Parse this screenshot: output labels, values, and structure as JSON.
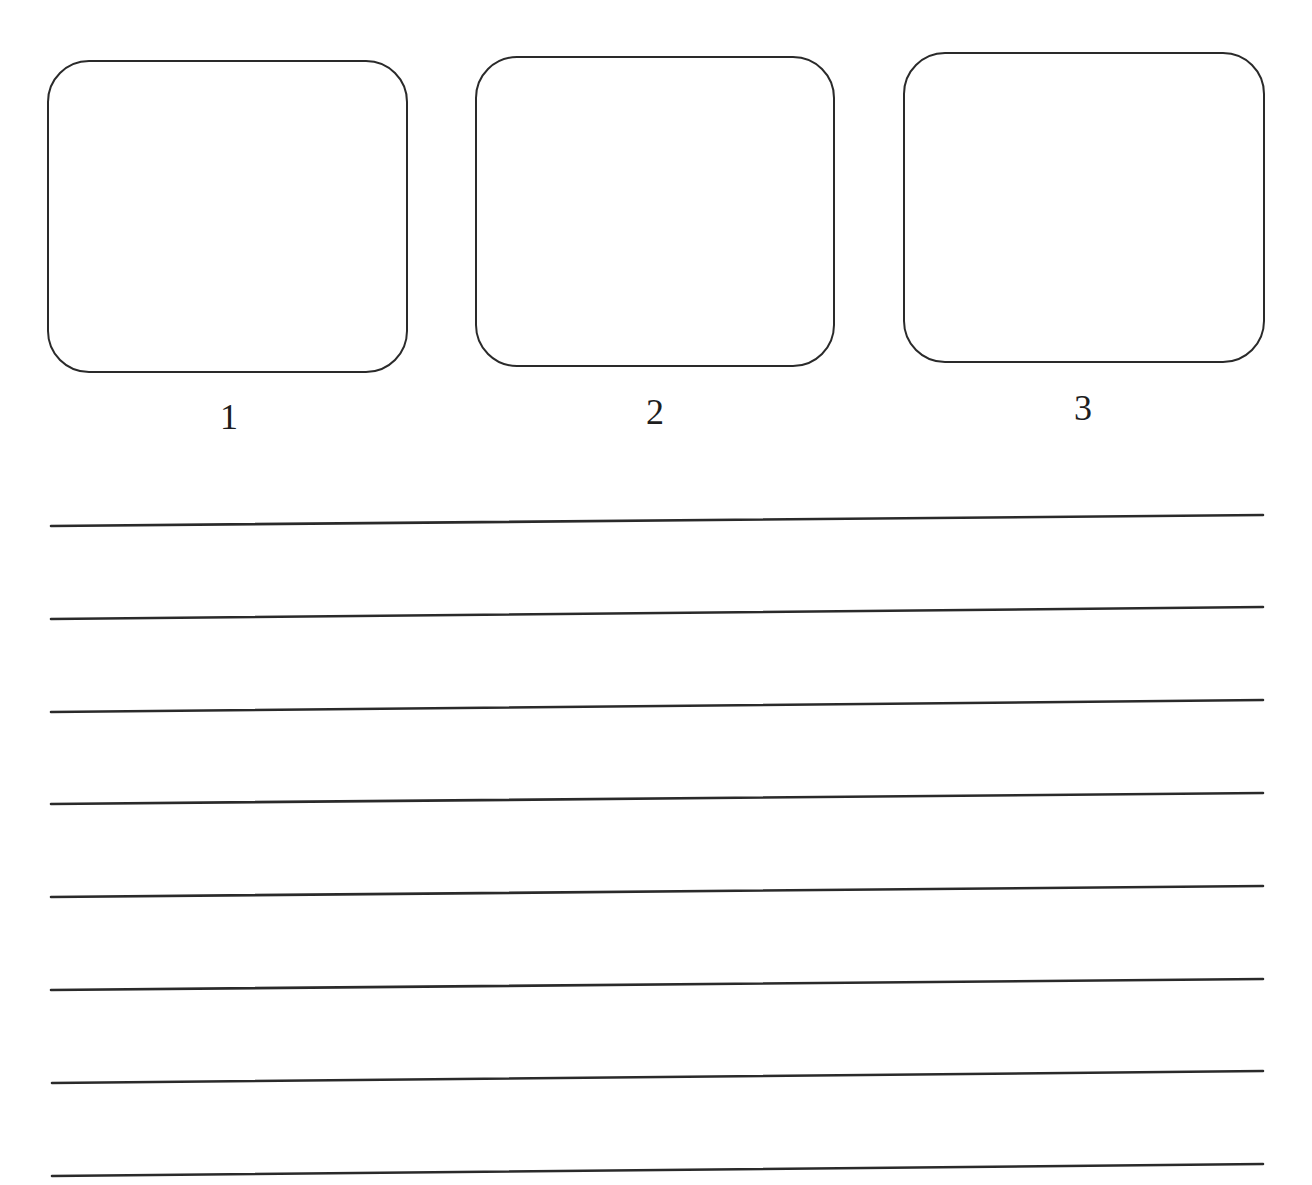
{
  "worksheet": {
    "boxes": [
      {
        "label": "1",
        "x": 47,
        "y": 60,
        "width": 361,
        "height": 313,
        "label_x": 229,
        "label_y": 399
      },
      {
        "label": "2",
        "x": 475,
        "y": 56,
        "width": 360,
        "height": 311,
        "label_x": 655,
        "label_y": 394
      },
      {
        "label": "3",
        "x": 903,
        "y": 52,
        "width": 362,
        "height": 311,
        "label_x": 1083,
        "label_y": 390
      }
    ],
    "writing_lines": [
      {
        "x1": 51,
        "y1": 526,
        "x2": 1263,
        "y2": 515
      },
      {
        "x1": 51,
        "y1": 619,
        "x2": 1263,
        "y2": 607
      },
      {
        "x1": 51,
        "y1": 712,
        "x2": 1263,
        "y2": 700
      },
      {
        "x1": 51,
        "y1": 804,
        "x2": 1263,
        "y2": 793
      },
      {
        "x1": 51,
        "y1": 897,
        "x2": 1263,
        "y2": 886
      },
      {
        "x1": 51,
        "y1": 990,
        "x2": 1263,
        "y2": 979
      },
      {
        "x1": 52,
        "y1": 1083,
        "x2": 1263,
        "y2": 1071
      },
      {
        "x1": 52,
        "y1": 1176,
        "x2": 1263,
        "y2": 1164
      }
    ],
    "colors": {
      "ink": "#2a2a2a",
      "paper": "#ffffff"
    }
  }
}
